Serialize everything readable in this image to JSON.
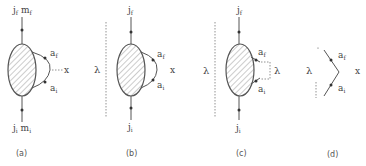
{
  "figure": {
    "panels": [
      {
        "id": "a",
        "caption": "(a)",
        "top_label": "j_f m_f",
        "bottom_label": "j_i m_i",
        "loop_top_label": "a_f",
        "loop_bottom_label": "a_i",
        "side_label": "x",
        "lambda_label": ""
      },
      {
        "id": "b",
        "caption": "(b)",
        "top_label": "j_f",
        "bottom_label": "j_i",
        "loop_top_label": "a_f",
        "loop_bottom_label": "a_i",
        "side_label": "x",
        "lambda_label": "λ"
      },
      {
        "id": "c",
        "caption": "(c)",
        "top_label": "j_f",
        "bottom_label": "j_i",
        "loop_top_label": "a_f",
        "loop_bottom_label": "a_i",
        "side_label": "λ",
        "lambda_label": "λ"
      },
      {
        "id": "d",
        "caption": "(d)",
        "top_label": "",
        "bottom_label": "",
        "loop_top_label": "a_f",
        "loop_bottom_label": "a_i",
        "side_label": "x",
        "lambda_label": "λ"
      }
    ],
    "colors": {
      "line": "#555555",
      "hatch": "#888888",
      "text": "#444444"
    }
  }
}
